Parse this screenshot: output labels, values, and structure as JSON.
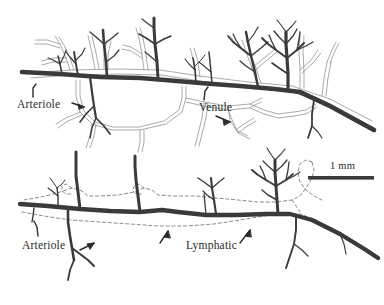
{
  "figure": {
    "type": "anatomical-line-diagram",
    "background_color": "#ffffff",
    "vessel_dark_color": "#3a3a3a",
    "vessel_light_color": "#8d8d8d",
    "lymphatic_color": "#6e6e6e"
  },
  "panels": [
    {
      "id": "upper-panel",
      "name": "arteriole-venule-panel",
      "labels": [
        {
          "id": "arteriole-top",
          "text": "Arteriole",
          "has_pointer": true
        },
        {
          "id": "venule-top",
          "text": "Venule",
          "has_pointer": true
        }
      ]
    },
    {
      "id": "lower-panel",
      "name": "arteriole-lymphatic-panel",
      "labels": [
        {
          "id": "arteriole-bottom",
          "text": "Arteriole",
          "has_pointer": true
        },
        {
          "id": "lymphatic-bottom",
          "text": "Lymphatic",
          "has_pointer": true
        }
      ]
    }
  ],
  "scale_bar": {
    "label": "1 mm",
    "length_px": 66,
    "units": "mm",
    "value": 1
  },
  "icons": {
    "pointer_arrow": "arrow-icon",
    "tick_pointer": "tick-pointer-icon",
    "scale_bar": "scale-bar-icon"
  }
}
